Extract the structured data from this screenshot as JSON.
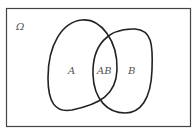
{
  "diagram": {
    "type": "venn",
    "universe_label": "Ω",
    "sets": [
      {
        "name": "A",
        "label": "A"
      },
      {
        "name": "B",
        "label": "B"
      }
    ],
    "intersection_label": "AB",
    "colors": {
      "stroke": "#222222",
      "border": "#444444",
      "text": "#555555",
      "background": "#ffffff"
    }
  }
}
